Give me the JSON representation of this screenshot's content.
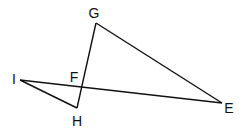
{
  "diagram": {
    "type": "geometry-figure",
    "stroke_color": "#111111",
    "background": "#ffffff",
    "points": {
      "G": {
        "label": "G",
        "x": 96,
        "y": 23,
        "label_x": 94,
        "label_y": 13
      },
      "I": {
        "label": "I",
        "x": 20,
        "y": 80,
        "label_x": 14,
        "label_y": 79
      },
      "H": {
        "label": "H",
        "x": 77,
        "y": 108,
        "label_x": 77,
        "label_y": 121
      },
      "F": {
        "label": "F",
        "x": 82,
        "y": 88,
        "label_x": 74,
        "label_y": 77
      },
      "E": {
        "label": "E",
        "x": 222,
        "y": 103,
        "label_x": 229,
        "label_y": 108
      }
    },
    "segments": [
      {
        "from": "G",
        "to": "E",
        "name": "GE"
      },
      {
        "from": "G",
        "to": "H",
        "name": "GH"
      },
      {
        "from": "I",
        "to": "E",
        "name": "IE"
      },
      {
        "from": "I",
        "to": "H",
        "name": "IH"
      }
    ],
    "intersection": {
      "point": "F",
      "of": [
        "GH",
        "IE"
      ]
    }
  }
}
